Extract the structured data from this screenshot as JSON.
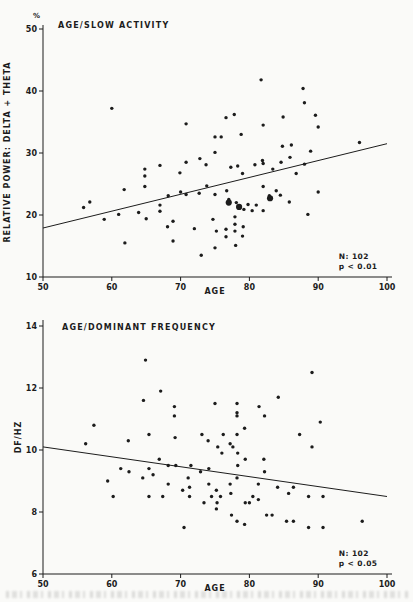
{
  "figure": {
    "background": "#fafaf8",
    "ink": "#1c1c1c"
  },
  "chart_data": [
    {
      "type": "scatter",
      "title": "AGE/SLOW ACTIVITY",
      "xlabel": "AGE",
      "ylabel": "RELATIVE POWER: DELTA + THETA",
      "y_unit": "%",
      "xlim": [
        50,
        100
      ],
      "ylim": [
        10,
        50
      ],
      "xticks": [
        50,
        60,
        70,
        80,
        90,
        100
      ],
      "yticks": [
        10,
        20,
        30,
        40,
        50
      ],
      "grid": false,
      "annotation": {
        "line1": "N: 102",
        "line2": "p < 0.01"
      },
      "regression": {
        "x": [
          50,
          100
        ],
        "y": [
          17.9,
          31.5
        ]
      },
      "emphasis_points": [
        [
          77,
          22.0
        ],
        [
          78.5,
          21.3
        ],
        [
          83,
          22.7
        ]
      ],
      "points": [
        [
          60,
          37.2
        ],
        [
          70.8,
          34.7
        ],
        [
          75,
          32.6
        ],
        [
          75.9,
          32.6
        ],
        [
          75,
          30.1
        ],
        [
          70.8,
          28.5
        ],
        [
          72.8,
          29.1
        ],
        [
          67,
          28.0
        ],
        [
          64.8,
          27.4
        ],
        [
          64.8,
          26.3
        ],
        [
          69.9,
          26.8
        ],
        [
          73.7,
          28.1
        ],
        [
          81.7,
          41.8
        ],
        [
          87.8,
          40.4
        ],
        [
          88,
          38.1
        ],
        [
          77.8,
          36.2
        ],
        [
          76.6,
          35.7
        ],
        [
          84.9,
          35.8
        ],
        [
          82,
          34.5
        ],
        [
          89.6,
          36.1
        ],
        [
          90,
          34.2
        ],
        [
          78.8,
          33.0
        ],
        [
          96,
          31.7
        ],
        [
          84.8,
          31.1
        ],
        [
          86.1,
          31.3
        ],
        [
          88.9,
          30.3
        ],
        [
          85.9,
          29.3
        ],
        [
          81.9,
          28.8
        ],
        [
          82,
          28.3
        ],
        [
          80.8,
          28.1
        ],
        [
          78.3,
          27.9
        ],
        [
          77.3,
          27.7
        ],
        [
          84.6,
          28.5
        ],
        [
          88,
          28.2
        ],
        [
          79,
          26.7
        ],
        [
          86.8,
          26.7
        ],
        [
          83.4,
          27.4
        ],
        [
          61.8,
          24.1
        ],
        [
          64.8,
          24.6
        ],
        [
          56.8,
          22.1
        ],
        [
          55.9,
          21.2
        ],
        [
          58.9,
          19.3
        ],
        [
          61,
          20.1
        ],
        [
          63.9,
          20.4
        ],
        [
          67,
          20.6
        ],
        [
          67,
          21.6
        ],
        [
          65,
          19.4
        ],
        [
          68.2,
          23.1
        ],
        [
          70,
          23.7
        ],
        [
          70.8,
          23.3
        ],
        [
          72.7,
          23.5
        ],
        [
          73.8,
          24.7
        ],
        [
          75,
          23.3
        ],
        [
          68.9,
          19.0
        ],
        [
          68.1,
          18.1
        ],
        [
          68.9,
          15.8
        ],
        [
          61.9,
          15.5
        ],
        [
          72,
          17.8
        ],
        [
          74.7,
          19.3
        ],
        [
          75.2,
          17.4
        ],
        [
          73,
          13.5
        ],
        [
          75,
          14.7
        ],
        [
          82,
          24.6
        ],
        [
          83.9,
          23.9
        ],
        [
          84.5,
          23.2
        ],
        [
          82.9,
          23.1
        ],
        [
          76.7,
          23.9
        ],
        [
          77,
          22.5
        ],
        [
          78.1,
          22.0
        ],
        [
          79.8,
          21.7
        ],
        [
          81,
          21.6
        ],
        [
          79.2,
          20.9
        ],
        [
          80.4,
          20.7
        ],
        [
          82,
          20.7
        ],
        [
          77.9,
          19.7
        ],
        [
          77.9,
          18.5
        ],
        [
          79.1,
          18.1
        ],
        [
          76.6,
          17.7
        ],
        [
          77.9,
          17.4
        ],
        [
          76.6,
          16.5
        ],
        [
          79,
          16.6
        ],
        [
          78,
          15.1
        ],
        [
          88.5,
          20.1
        ],
        [
          90,
          23.7
        ],
        [
          85.8,
          22.1
        ]
      ]
    },
    {
      "type": "scatter",
      "title": "AGE/DOMINANT FREQUENCY",
      "xlabel": "AGE",
      "ylabel": "DF/HZ",
      "y_unit": "",
      "xlim": [
        50,
        100
      ],
      "ylim": [
        6,
        14
      ],
      "xticks": [
        50,
        60,
        70,
        80,
        90,
        100
      ],
      "yticks": [
        6,
        8,
        10,
        12,
        14
      ],
      "grid": false,
      "annotation": {
        "line1": "N: 102",
        "line2": "p < 0.05"
      },
      "regression": {
        "x": [
          50,
          100
        ],
        "y": [
          10.1,
          8.5
        ]
      },
      "emphasis_points": [],
      "points": [
        [
          64.9,
          12.9
        ],
        [
          67.1,
          11.9
        ],
        [
          64.6,
          11.6
        ],
        [
          69.1,
          11.4
        ],
        [
          69.1,
          11.1
        ],
        [
          75,
          11.5
        ],
        [
          57.4,
          10.8
        ],
        [
          56.2,
          10.2
        ],
        [
          62.4,
          10.3
        ],
        [
          65.4,
          10.5
        ],
        [
          69.2,
          10.4
        ],
        [
          73.1,
          10.5
        ],
        [
          74,
          10.3
        ],
        [
          75.4,
          10.1
        ],
        [
          89.1,
          12.5
        ],
        [
          84.2,
          11.7
        ],
        [
          78.2,
          11.5
        ],
        [
          81.4,
          11.4
        ],
        [
          78.2,
          11.2
        ],
        [
          78.2,
          11.1
        ],
        [
          82.2,
          11.1
        ],
        [
          90.3,
          10.9
        ],
        [
          79.3,
          10.7
        ],
        [
          76.2,
          10.5
        ],
        [
          78.2,
          10.5
        ],
        [
          87.3,
          10.5
        ],
        [
          77.2,
          10.2
        ],
        [
          77.6,
          10.1
        ],
        [
          76,
          9.9
        ],
        [
          78.3,
          9.9
        ],
        [
          89.1,
          10.1
        ],
        [
          79.4,
          9.7
        ],
        [
          82.1,
          9.7
        ],
        [
          66.9,
          9.7
        ],
        [
          61.3,
          9.4
        ],
        [
          65.4,
          9.4
        ],
        [
          68.2,
          9.5
        ],
        [
          69.3,
          9.5
        ],
        [
          71.5,
          9.5
        ],
        [
          72.9,
          9.3
        ],
        [
          74.1,
          9.4
        ],
        [
          62.5,
          9.3
        ],
        [
          59.4,
          9.0
        ],
        [
          64.5,
          9.1
        ],
        [
          66,
          9.2
        ],
        [
          71.1,
          9.1
        ],
        [
          71.3,
          8.8
        ],
        [
          68.2,
          8.9
        ],
        [
          70.3,
          8.7
        ],
        [
          60.2,
          8.5
        ],
        [
          65.4,
          8.5
        ],
        [
          67.4,
          8.5
        ],
        [
          71.3,
          8.5
        ],
        [
          74.1,
          8.9
        ],
        [
          75.2,
          8.7
        ],
        [
          74.5,
          8.5
        ],
        [
          75.8,
          8.5
        ],
        [
          73.4,
          8.3
        ],
        [
          75.3,
          8.3
        ],
        [
          75.2,
          8.1
        ],
        [
          70.5,
          7.5
        ],
        [
          78.3,
          9.5
        ],
        [
          82.2,
          9.3
        ],
        [
          78.2,
          9.1
        ],
        [
          77.2,
          8.9
        ],
        [
          81.3,
          8.9
        ],
        [
          84.1,
          8.8
        ],
        [
          86.4,
          8.8
        ],
        [
          77.3,
          8.6
        ],
        [
          80.5,
          8.5
        ],
        [
          81.3,
          8.4
        ],
        [
          79.4,
          8.3
        ],
        [
          80,
          8.3
        ],
        [
          85.7,
          8.6
        ],
        [
          88.6,
          8.5
        ],
        [
          90.7,
          8.5
        ],
        [
          77.4,
          7.9
        ],
        [
          82.5,
          7.9
        ],
        [
          83.3,
          7.9
        ],
        [
          78.2,
          7.7
        ],
        [
          79.3,
          7.6
        ],
        [
          85.4,
          7.7
        ],
        [
          86.4,
          7.7
        ],
        [
          88.6,
          7.5
        ],
        [
          90.7,
          7.5
        ],
        [
          96.4,
          7.7
        ]
      ]
    }
  ]
}
